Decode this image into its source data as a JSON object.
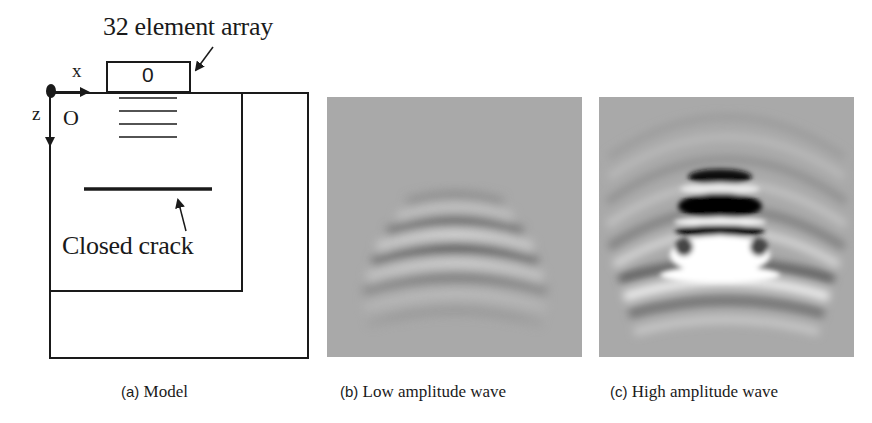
{
  "figure": {
    "panels": [
      {
        "id": "a",
        "caption_label": "(a)",
        "caption_text": "Model",
        "annotations": {
          "array_label": "32 element array",
          "array_symbol": "0",
          "crack_label": "Closed crack",
          "axis_x": "x",
          "axis_z": "z",
          "origin": "O"
        }
      },
      {
        "id": "b",
        "caption_label": "(b)",
        "caption_text": "Low amplitude wave"
      },
      {
        "id": "c",
        "caption_label": "(c)",
        "caption_text": "High amplitude wave"
      }
    ],
    "colors": {
      "line": "#1a1a1a",
      "field_background": "#a9a9a9",
      "wave_dark": "#000000",
      "wave_light": "#ffffff"
    }
  }
}
